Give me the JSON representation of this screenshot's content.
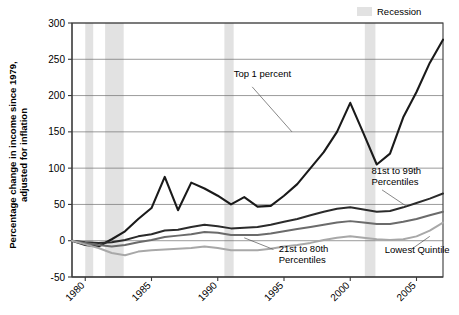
{
  "chart_data": {
    "type": "line",
    "title": "",
    "xlabel": "",
    "ylabel": "Percentage change in income since 1979,",
    "ylabel_line2": "adjusted for inflation",
    "xlim": [
      1979,
      2007
    ],
    "ylim": [
      -50,
      300
    ],
    "yticks": [
      -50,
      0,
      50,
      100,
      150,
      200,
      250,
      300
    ],
    "ytick_labels": [
      "-50",
      "0",
      "50",
      "100",
      "150",
      "200",
      "250",
      "300"
    ],
    "xticks": [
      1980,
      1985,
      1990,
      1995,
      2000,
      2005
    ],
    "xtick_labels": [
      "1980",
      "1985",
      "1990",
      "1995",
      "2000",
      "2005"
    ],
    "grid": true,
    "legend": {
      "position": "top-right",
      "entries": [
        {
          "label": "Recession",
          "color": "#e2e2e2",
          "type": "band"
        }
      ]
    },
    "recession_bands": [
      {
        "start": 1980.0,
        "end": 1980.6
      },
      {
        "start": 1981.5,
        "end": 1982.9
      },
      {
        "start": 1990.5,
        "end": 1991.2
      },
      {
        "start": 2001.1,
        "end": 2001.9
      }
    ],
    "x": [
      1979,
      1980,
      1981,
      1982,
      1983,
      1984,
      1985,
      1986,
      1987,
      1988,
      1989,
      1990,
      1991,
      1992,
      1993,
      1994,
      1995,
      1996,
      1997,
      1998,
      1999,
      2000,
      2001,
      2002,
      2003,
      2004,
      2005,
      2006,
      2007
    ],
    "series": [
      {
        "name": "Top 1 percent",
        "color": "#1a1a1a",
        "width": 2.1,
        "values": [
          0,
          -6,
          -8,
          2,
          13,
          30,
          45,
          88,
          42,
          80,
          72,
          62,
          50,
          60,
          47,
          48,
          62,
          78,
          100,
          122,
          150,
          190,
          148,
          105,
          120,
          170,
          205,
          245,
          277
        ],
        "label_x": 1991.2,
        "label_y": 225,
        "leader": [
          [
            1992.6,
            212
          ],
          [
            1995.6,
            150
          ]
        ]
      },
      {
        "name": "81st to 99th",
        "name_line2": "Percentiles",
        "color": "#2b2b2b",
        "width": 2.0,
        "values": [
          0,
          -2,
          -3,
          -2,
          1,
          6,
          9,
          14,
          15,
          19,
          22,
          20,
          17,
          18,
          19,
          22,
          26,
          30,
          35,
          40,
          44,
          46,
          43,
          40,
          41,
          46,
          52,
          58,
          65
        ],
        "label_x": 2001.6,
        "label_y": 92,
        "leader": [
          [
            2002.4,
            70
          ],
          [
            2004.2,
            48
          ]
        ]
      },
      {
        "name": "21st to 80th",
        "name_line2": "Percentiles",
        "color": "#6b6b6b",
        "width": 2.0,
        "values": [
          0,
          -3,
          -6,
          -8,
          -6,
          -2,
          1,
          5,
          7,
          9,
          12,
          11,
          8,
          8,
          8,
          10,
          13,
          16,
          19,
          22,
          25,
          27,
          25,
          23,
          23,
          26,
          30,
          35,
          40
        ],
        "label_x": 1994.6,
        "label_y": -16,
        "leader": [
          [
            1994.2,
            -12
          ],
          [
            1992.0,
            4
          ]
        ]
      },
      {
        "name": "Lowest Quintile",
        "color": "#a8a8a8",
        "width": 2.0,
        "values": [
          0,
          -5,
          -10,
          -17,
          -20,
          -15,
          -13,
          -12,
          -11,
          -10,
          -8,
          -10,
          -13,
          -13,
          -13,
          -11,
          -8,
          -6,
          -3,
          1,
          4,
          6,
          4,
          2,
          1,
          2,
          6,
          14,
          25
        ],
        "label_x": 2002.6,
        "label_y": -17,
        "leader": [
          [
            2004.6,
            -12
          ],
          [
            2006.0,
            6
          ]
        ]
      }
    ]
  }
}
